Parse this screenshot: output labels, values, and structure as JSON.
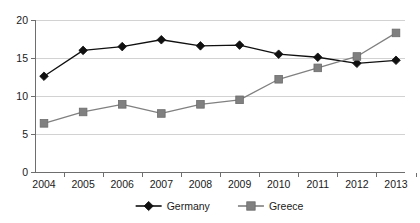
{
  "chart_data": {
    "type": "line",
    "title": "",
    "subtitle": "",
    "xlabel": "",
    "ylabel": "",
    "categories": [
      "2004",
      "2005",
      "2006",
      "2007",
      "2008",
      "2009",
      "2010",
      "2011",
      "2012",
      "2013"
    ],
    "series": [
      {
        "name": "Germany",
        "marker": "diamond",
        "color": "#101010",
        "values": [
          12.6,
          16.0,
          16.5,
          17.4,
          16.6,
          16.7,
          15.5,
          15.1,
          14.3,
          14.7
        ]
      },
      {
        "name": "Greece",
        "marker": "square",
        "color": "#808080",
        "values": [
          6.4,
          7.9,
          8.9,
          7.7,
          8.9,
          9.5,
          12.2,
          13.7,
          15.2,
          18.3
        ]
      }
    ],
    "ylim": [
      0,
      20
    ],
    "yticks": [
      0,
      5,
      10,
      15,
      20
    ],
    "ytick_labels": [
      "0",
      "5",
      "10",
      "15",
      "20"
    ],
    "xtick_labels": [
      "2004",
      "2005",
      "2006",
      "2007",
      "2008",
      "2009",
      "2010",
      "2011",
      "2012",
      "2013"
    ],
    "grid": true,
    "grid_axis": "y",
    "legend_position": "bottom",
    "legend_entries": [
      "Germany",
      "Greece"
    ]
  },
  "colors": {
    "germany": "#101010",
    "greece": "#808080",
    "gridline": "#d2d2d2",
    "axis": "#6e6e6e",
    "background": "#ffffff",
    "text": "#1a1a1a"
  }
}
